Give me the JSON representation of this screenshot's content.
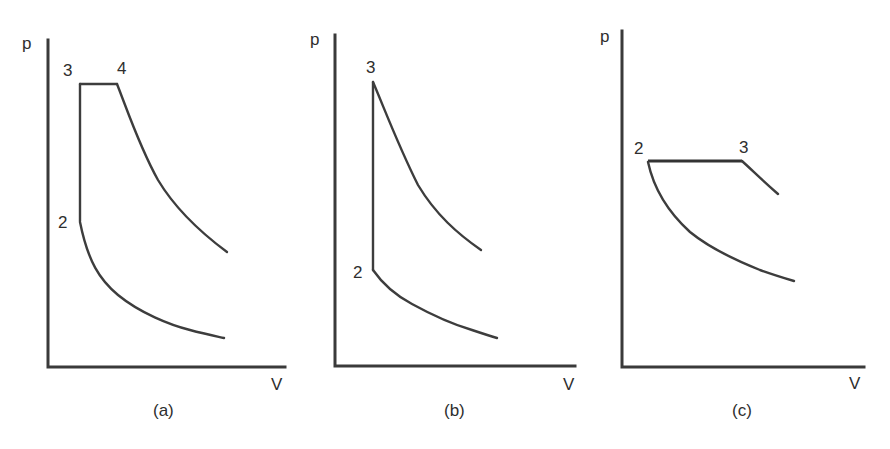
{
  "figure": {
    "panels": [
      {
        "id": "a",
        "caption": "(a)",
        "y_axis_label": "p",
        "x_axis_label": "V",
        "state_labels": [
          "2",
          "3",
          "4"
        ],
        "description": "Dual/limited-pressure cycle: constant-volume heat addition 2-3, constant-pressure heat addition 3-4, expansion from 4, compression curve ending at 2"
      },
      {
        "id": "b",
        "caption": "(b)",
        "y_axis_label": "p",
        "x_axis_label": "V",
        "state_labels": [
          "2",
          "3"
        ],
        "description": "Otto cycle: constant-volume heat addition 2-3, expansion from 3, compression curve ending at 2"
      },
      {
        "id": "c",
        "caption": "(c)",
        "y_axis_label": "p",
        "x_axis_label": "V",
        "state_labels": [
          "2",
          "3"
        ],
        "description": "Diesel cycle: constant-pressure heat addition 2-3, short expansion from 3, compression curve ending at 2"
      }
    ]
  },
  "colors": {
    "line": "#3d3d3d",
    "axis": "#3a3a3a",
    "text": "#2e2e2e",
    "background": "#ffffff"
  }
}
